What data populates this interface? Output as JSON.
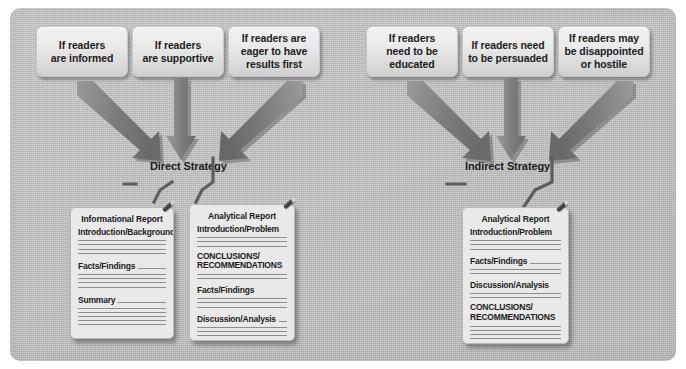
{
  "diagram": {
    "background_color": "#bcbcbc",
    "frame_color": "#ffffff",
    "arrow_color": "#7c7c7c",
    "line_color": "#8e8e8e"
  },
  "left_branch": {
    "strategy_label": "Direct Strategy",
    "conditions": [
      {
        "id": "cond-informed",
        "text": "If readers\nare informed"
      },
      {
        "id": "cond-supportive",
        "text": "If readers\nare supportive"
      },
      {
        "id": "cond-eager",
        "text": "If readers are\neager to have\nresults first"
      }
    ],
    "documents": [
      {
        "id": "doc-informational-report",
        "title": "Informational Report",
        "sections": [
          "Introduction/Background",
          "Facts/Findings",
          "Summary"
        ]
      },
      {
        "id": "doc-analytical-report-direct",
        "title": "Analytical Report",
        "sections": [
          "Introduction/Problem",
          "CONCLUSIONS/\nRECOMMENDATIONS",
          "Facts/Findings",
          "Discussion/Analysis"
        ]
      }
    ]
  },
  "right_branch": {
    "strategy_label": "Indirect Strategy",
    "conditions": [
      {
        "id": "cond-educated",
        "text": "If readers\nneed to be\neducated"
      },
      {
        "id": "cond-persuaded",
        "text": "If readers need\nto be persuaded"
      },
      {
        "id": "cond-hostile",
        "text": "If readers may\nbe disappointed\nor hostile"
      }
    ],
    "documents": [
      {
        "id": "doc-analytical-report-indirect",
        "title": "Analytical Report",
        "sections": [
          "Introduction/Problem",
          "Facts/Findings",
          "Discussion/Analysis",
          "CONCLUSIONS/\nRECOMMENDATIONS"
        ]
      }
    ]
  },
  "icons": {
    "arrow_down": "arrow-down-icon",
    "arrow_diag_right": "arrow-diagonal-down-right-icon",
    "arrow_diag_left": "arrow-diagonal-down-left-icon",
    "paper_clip": "paper-clip-icon"
  }
}
